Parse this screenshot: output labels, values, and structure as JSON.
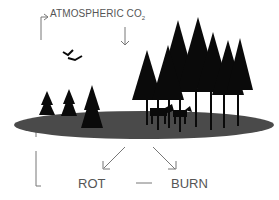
{
  "diagram": {
    "labels": {
      "source": "ATMOSPHERIC CO",
      "source_subscript": "2",
      "rot": "ROT",
      "burn": "BURN"
    },
    "illustration": {
      "ground": "forest-floor-ellipse",
      "trees": "spruce-trees",
      "animals": [
        "moose",
        "moose"
      ],
      "birds": [
        "bird",
        "bird"
      ]
    },
    "colors": {
      "line": "#777777",
      "text": "#555555",
      "ground": "#4a4a4a",
      "trees": "#0a0a0a"
    }
  }
}
